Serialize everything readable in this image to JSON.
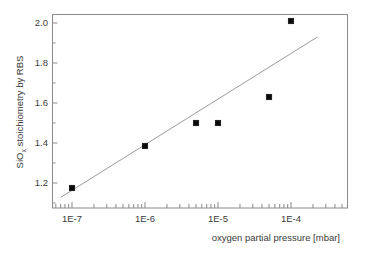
{
  "chart_data": {
    "type": "scatter",
    "title": "",
    "xlabel": "oxygen partial pressure [mbar]",
    "ylabel_main": "SiO",
    "ylabel_sub": "x",
    "ylabel_rest": " stoichiometry by RBS",
    "ylabel_full": "SiOx stoichiometry by RBS",
    "xscale": "log",
    "yscale": "linear",
    "xlim": [
      5e-08,
      0.0003
    ],
    "ylim": [
      1.09,
      2.07
    ],
    "grid": false,
    "legend": "none",
    "x_tick_labels": [
      "1E-7",
      "1E-6",
      "1E-5",
      "1E-4"
    ],
    "x_tick_values": [
      1e-07,
      1e-06,
      1e-05,
      0.0001
    ],
    "y_tick_labels": [
      "1.2",
      "1.4",
      "1.6",
      "1.8",
      "2.0"
    ],
    "y_tick_values": [
      1.2,
      1.4,
      1.6,
      1.8,
      2.0
    ],
    "series": [
      {
        "name": "RBS measurements",
        "marker": "square",
        "color": "#0a0a0a",
        "points": [
          {
            "x": 1e-07,
            "y": 1.175
          },
          {
            "x": 1e-06,
            "y": 1.385
          },
          {
            "x": 5e-06,
            "y": 1.5
          },
          {
            "x": 1e-05,
            "y": 1.5
          },
          {
            "x": 5e-05,
            "y": 1.63
          },
          {
            "x": 0.0001,
            "y": 2.01
          }
        ]
      },
      {
        "name": "linear fit",
        "marker": "none",
        "color": "#9a9a9a",
        "points": [
          {
            "x": 7e-08,
            "y": 1.128
          },
          {
            "x": 0.00023,
            "y": 1.93
          }
        ]
      }
    ]
  }
}
